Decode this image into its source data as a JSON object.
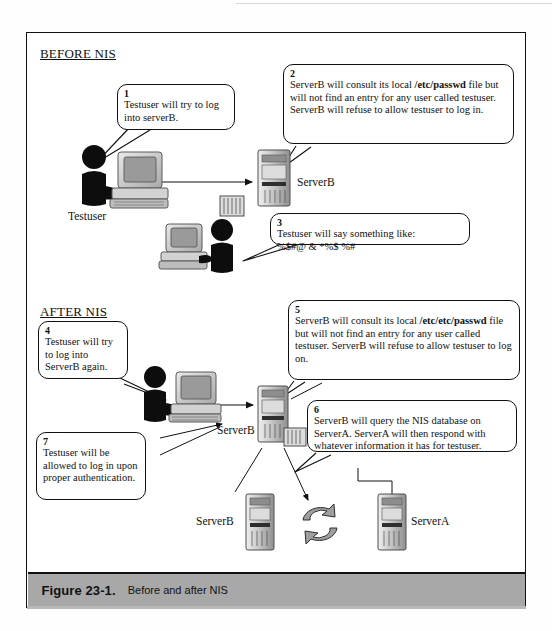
{
  "figure": {
    "caption_number": "Figure 23-1.",
    "caption_text": "Before and after NIS"
  },
  "sections": {
    "before": {
      "heading": "BEFORE NIS"
    },
    "after": {
      "heading": "AFTER NIS"
    }
  },
  "callouts": [
    {
      "num": "1",
      "lines": [
        "Testuser will try to",
        "log into serverB."
      ],
      "text": "Testuser will try to log into serverB."
    },
    {
      "num": "2",
      "text_before_bold": "ServerB will consult its local ",
      "bold": "/etc/passwd",
      "text_after_bold": " file but will not find an entry for any user called testuser. ServerB will refuse to allow testuser to log in.",
      "text": "ServerB will consult its local /etc/passwd file but will not find an entry for any user called testuser. ServerB will refuse to allow testuser to log in."
    },
    {
      "num": "3",
      "line1": "Testuser will say something like:",
      "line2": "%$#@ & *%$ %#",
      "text": "Testuser will say something like: %$#@ & *%$ %#"
    },
    {
      "num": "4",
      "lines": [
        "Testuser will",
        "try to log into",
        "ServerB again."
      ],
      "text": "Testuser will try to log into ServerB again."
    },
    {
      "num": "5",
      "text_before_bold": "ServerB will consult its local ",
      "bold": "/etc/etc/passwd",
      "text_after_bold": " file but will not find an entry for any user called testuser. ServerB will refuse to allow testuser to log on.",
      "text": "ServerB will consult its local /etc/etc/passwd file but will not find an entry for any user called testuser. ServerB will refuse to allow testuser to log on."
    },
    {
      "num": "6",
      "text": "ServerB will query the NIS database on ServerA. ServerA will then respond with whatever information it has for testuser."
    },
    {
      "num": "7",
      "lines": [
        "Testuser will be",
        "allowed to log in",
        "upon proper",
        "authentication."
      ],
      "text": "Testuser will be allowed to log in upon proper authentication."
    }
  ],
  "nodes": {
    "user_before": {
      "label": "Testuser"
    },
    "server_before": {
      "label": "ServerB"
    },
    "server_after_top": {
      "label": "ServerB"
    },
    "server_bottom_left": {
      "label": "ServerB"
    },
    "server_bottom_right": {
      "label": "ServerA"
    }
  },
  "colors": {
    "ink": "#111111",
    "caption_bar": "#a8a8a8",
    "silhouette": "#0d0d0d",
    "device_gray": "#c9c9c9"
  }
}
